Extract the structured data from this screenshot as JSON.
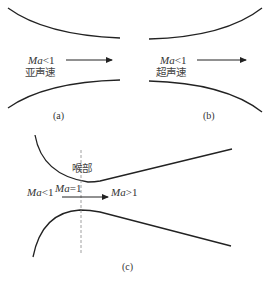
{
  "panels": {
    "a": {
      "caption": "(a)",
      "mach_label_var": "Ma",
      "mach_label_rel": "<1",
      "flow_text": "亚声速",
      "shape": "converging nozzle"
    },
    "b": {
      "caption": "(b)",
      "mach_label_var": "Ma",
      "mach_label_rel": "<1",
      "flow_text": "超声速",
      "shape": "diverging nozzle"
    },
    "c": {
      "caption": "(c)",
      "throat_label": "喉部",
      "inlet_var": "Ma",
      "inlet_rel": "<1",
      "throat_var": "Ma",
      "throat_rel": "=1",
      "outlet_var": "Ma",
      "outlet_rel": ">1",
      "shape": "converging-diverging (Laval) nozzle"
    }
  },
  "colors": {
    "line": "#222222",
    "text": "#333333",
    "dashed": "#888888"
  }
}
